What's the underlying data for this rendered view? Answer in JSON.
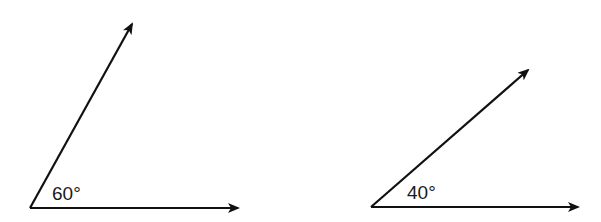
{
  "diagram": {
    "angles": [
      {
        "label": "60°",
        "vertex": [
          30,
          208
        ],
        "horizontal_ray_end": [
          240,
          208
        ],
        "upper_ray_end": [
          133,
          22
        ],
        "label_position": [
          52,
          200
        ]
      },
      {
        "label": "40°",
        "vertex": [
          371,
          207
        ],
        "horizontal_ray_end": [
          580,
          207
        ],
        "upper_ray_end": [
          530,
          68
        ],
        "label_position": [
          407,
          199
        ]
      }
    ],
    "stroke_color": "#111111"
  }
}
